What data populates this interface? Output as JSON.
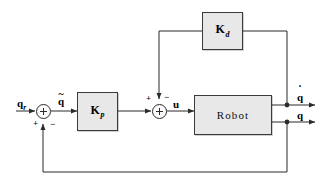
{
  "diagram": {
    "colors": {
      "block_fill": "#e8e8e8",
      "block_border": "#3a3a3a",
      "wire": "#2b2b2b",
      "background": "#ffffff"
    },
    "blocks": [
      {
        "id": "kp",
        "label": "K",
        "subscript": "p",
        "kind": "gain"
      },
      {
        "id": "kd",
        "label": "K",
        "subscript": "d",
        "kind": "gain"
      },
      {
        "id": "robot",
        "label": "Robot",
        "kind": "plant"
      }
    ],
    "signals": {
      "reference": {
        "base": "q",
        "subscript": "r",
        "accent": ""
      },
      "error": {
        "base": "q",
        "subscript": "",
        "accent": "~"
      },
      "control": {
        "base": "u",
        "subscript": "",
        "accent": ""
      },
      "velocity_output": {
        "base": "q",
        "subscript": "",
        "accent": "˙"
      },
      "position_output": {
        "base": "q",
        "subscript": "",
        "accent": ""
      }
    },
    "summing_junctions": [
      {
        "id": "sum-error",
        "signs": [
          {
            "text": "+",
            "position": "bottom-left"
          },
          {
            "text": "−",
            "position": "bottom-right"
          }
        ]
      },
      {
        "id": "sum-control",
        "signs": [
          {
            "text": "+",
            "position": "top-left"
          },
          {
            "text": "−",
            "position": "top-right"
          }
        ]
      }
    ]
  }
}
